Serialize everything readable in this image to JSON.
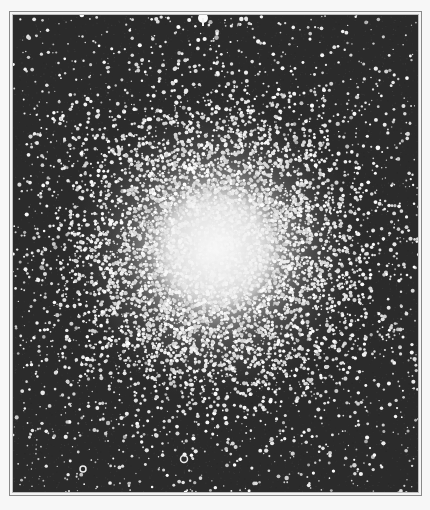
{
  "image": {
    "subject": "globular star cluster photograph",
    "style": "black-and-white astronomical photograph",
    "alt": "Dense globular star cluster with a bright white core surrounded by scattered stars on a dark field",
    "colors": {
      "page_background": "#f7f7f7",
      "frame_line": "#8a8a8a",
      "sky_background": "#2b2b2b",
      "star": "#f2f2f2",
      "core": "#f6f6f6"
    },
    "frame": {
      "outer": {
        "x": 9,
        "y": 11,
        "width": 413,
        "height": 485
      },
      "inner": {
        "x": 12,
        "y": 14,
        "width": 407,
        "height": 479
      }
    },
    "cluster_core": {
      "cx": 215,
      "cy": 248,
      "radius": 95
    },
    "notable_stars": [
      {
        "name": "bright-star-top",
        "x": 202,
        "y": 17,
        "r": 5
      },
      {
        "name": "ring-star-bottom",
        "x": 183,
        "y": 458,
        "r": 3.5
      },
      {
        "name": "ring-star-bottom-left",
        "x": 82,
        "y": 468,
        "r": 3
      }
    ]
  }
}
